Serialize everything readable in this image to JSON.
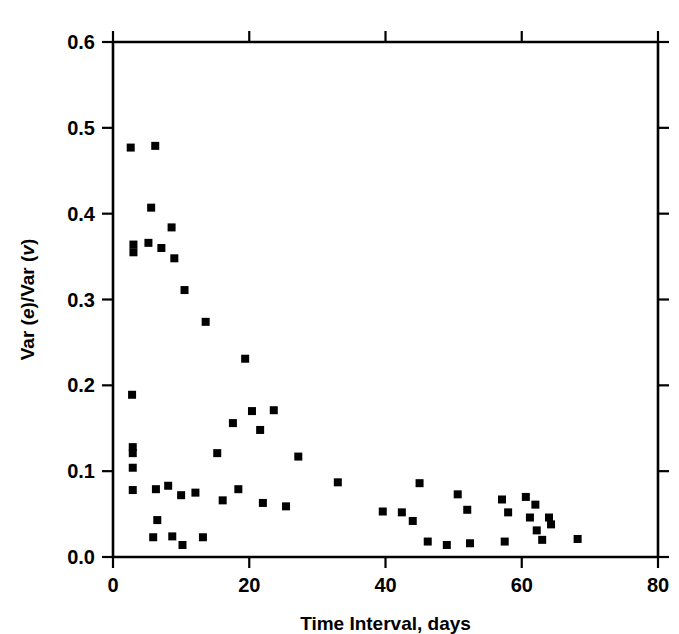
{
  "chart_data": {
    "type": "scatter",
    "title": "",
    "xlabel": "Time Interval, days",
    "ylabel": "Var (e)/Var (v)",
    "ylabel_parts": {
      "prefix": "Var (",
      "italic1": "e",
      "middle": ")/Var (",
      "italic2": "v",
      "suffix": ")"
    },
    "xlim": [
      0,
      80
    ],
    "ylim": [
      0.0,
      0.6
    ],
    "xticks": [
      0,
      20,
      40,
      60,
      80
    ],
    "yticks": [
      0.0,
      0.1,
      0.2,
      0.3,
      0.4,
      0.5,
      0.6
    ],
    "xticklabels": [
      "0",
      "20",
      "40",
      "60",
      "80"
    ],
    "yticklabels": [
      "0.0",
      "0.1",
      "0.2",
      "0.3",
      "0.4",
      "0.5",
      "0.6"
    ],
    "grid": false,
    "legend": null,
    "marker": "filled-square",
    "marker_color": "#000000",
    "marker_size_px": 8,
    "frame": "box-all-four-sides-ticks-outward",
    "n_points": 56,
    "points": [
      {
        "x": 2.6,
        "y": 0.477
      },
      {
        "x": 6.2,
        "y": 0.479
      },
      {
        "x": 5.6,
        "y": 0.407
      },
      {
        "x": 8.6,
        "y": 0.384
      },
      {
        "x": 3.0,
        "y": 0.364
      },
      {
        "x": 5.2,
        "y": 0.366
      },
      {
        "x": 7.1,
        "y": 0.36
      },
      {
        "x": 3.0,
        "y": 0.355
      },
      {
        "x": 9.0,
        "y": 0.348
      },
      {
        "x": 10.5,
        "y": 0.311
      },
      {
        "x": 13.6,
        "y": 0.274
      },
      {
        "x": 19.4,
        "y": 0.231
      },
      {
        "x": 2.8,
        "y": 0.189
      },
      {
        "x": 20.4,
        "y": 0.17
      },
      {
        "x": 23.6,
        "y": 0.171
      },
      {
        "x": 17.6,
        "y": 0.156
      },
      {
        "x": 21.6,
        "y": 0.148
      },
      {
        "x": 2.9,
        "y": 0.128
      },
      {
        "x": 2.9,
        "y": 0.121
      },
      {
        "x": 15.3,
        "y": 0.121
      },
      {
        "x": 27.2,
        "y": 0.117
      },
      {
        "x": 2.9,
        "y": 0.104
      },
      {
        "x": 33.0,
        "y": 0.087
      },
      {
        "x": 45.0,
        "y": 0.086
      },
      {
        "x": 60.6,
        "y": 0.07
      },
      {
        "x": 6.3,
        "y": 0.079
      },
      {
        "x": 8.1,
        "y": 0.083
      },
      {
        "x": 2.9,
        "y": 0.078
      },
      {
        "x": 18.4,
        "y": 0.079
      },
      {
        "x": 10.0,
        "y": 0.072
      },
      {
        "x": 12.1,
        "y": 0.075
      },
      {
        "x": 50.6,
        "y": 0.073
      },
      {
        "x": 57.1,
        "y": 0.067
      },
      {
        "x": 62.0,
        "y": 0.061
      },
      {
        "x": 16.1,
        "y": 0.066
      },
      {
        "x": 22.0,
        "y": 0.063
      },
      {
        "x": 25.4,
        "y": 0.059
      },
      {
        "x": 39.6,
        "y": 0.053
      },
      {
        "x": 42.4,
        "y": 0.052
      },
      {
        "x": 52.0,
        "y": 0.055
      },
      {
        "x": 58.0,
        "y": 0.052
      },
      {
        "x": 61.2,
        "y": 0.046
      },
      {
        "x": 64.0,
        "y": 0.046
      },
      {
        "x": 6.5,
        "y": 0.043
      },
      {
        "x": 44.0,
        "y": 0.042
      },
      {
        "x": 64.3,
        "y": 0.038
      },
      {
        "x": 5.9,
        "y": 0.023
      },
      {
        "x": 8.7,
        "y": 0.024
      },
      {
        "x": 10.2,
        "y": 0.014
      },
      {
        "x": 13.2,
        "y": 0.023
      },
      {
        "x": 46.2,
        "y": 0.018
      },
      {
        "x": 49.0,
        "y": 0.014
      },
      {
        "x": 52.4,
        "y": 0.016
      },
      {
        "x": 57.5,
        "y": 0.018
      },
      {
        "x": 62.2,
        "y": 0.031
      },
      {
        "x": 63.0,
        "y": 0.02
      },
      {
        "x": 68.2,
        "y": 0.021
      }
    ]
  }
}
